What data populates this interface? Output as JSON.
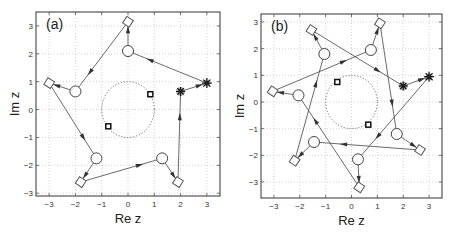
{
  "chart_data": [
    {
      "type": "scatter",
      "title": "(a)",
      "xlabel": "Re z",
      "ylabel": "Im z",
      "xlim": [
        -3.5,
        3.5
      ],
      "ylim": [
        -3.1,
        3.5
      ],
      "xticks": [
        -3,
        -2,
        -1,
        0,
        1,
        2,
        3
      ],
      "yticks": [
        -3,
        -2,
        -1,
        0,
        1,
        2,
        3
      ],
      "grid": true,
      "unit_circle": {
        "center": [
          0,
          0
        ],
        "radius": 1,
        "style": "dotted"
      },
      "path": [
        {
          "x": 2.0,
          "y": 0.65,
          "marker": "star"
        },
        {
          "x": 3.0,
          "y": 0.95,
          "marker": "star-filled"
        },
        {
          "x": 0.0,
          "y": 2.1,
          "marker": "circle"
        },
        {
          "x": 0.0,
          "y": 3.15,
          "marker": "diamond"
        },
        {
          "x": -2.0,
          "y": 0.65,
          "marker": "circle"
        },
        {
          "x": -3.0,
          "y": 0.95,
          "marker": "diamond"
        },
        {
          "x": -1.2,
          "y": -1.75,
          "marker": "circle"
        },
        {
          "x": -1.8,
          "y": -2.6,
          "marker": "diamond"
        },
        {
          "x": 1.3,
          "y": -1.75,
          "marker": "circle"
        },
        {
          "x": 1.9,
          "y": -2.6,
          "marker": "diamond"
        },
        {
          "x": 2.0,
          "y": 0.65,
          "marker": "star"
        }
      ],
      "squares": [
        {
          "x": 0.85,
          "y": 0.55
        },
        {
          "x": -0.75,
          "y": -0.6
        }
      ]
    },
    {
      "type": "scatter",
      "title": "(b)",
      "xlabel": "Re z",
      "ylabel": "Im z",
      "xlim": [
        -3.5,
        3.5
      ],
      "ylim": [
        -3.6,
        3.3
      ],
      "xticks": [
        -3,
        -2,
        -1,
        0,
        1,
        2,
        3
      ],
      "yticks": [
        -3,
        -2,
        -1,
        0,
        1,
        2,
        3
      ],
      "grid": true,
      "unit_circle": {
        "center": [
          0,
          0
        ],
        "radius": 1,
        "style": "dotted"
      },
      "path": [
        {
          "x": 2.0,
          "y": 0.6,
          "marker": "star"
        },
        {
          "x": 3.0,
          "y": 0.95,
          "marker": "star-filled"
        },
        {
          "x": 0.25,
          "y": -2.15,
          "marker": "circle"
        },
        {
          "x": 0.3,
          "y": -3.2,
          "marker": "diamond"
        },
        {
          "x": -2.05,
          "y": 0.25,
          "marker": "circle"
        },
        {
          "x": -3.05,
          "y": 0.4,
          "marker": "diamond"
        },
        {
          "x": 0.75,
          "y": 1.95,
          "marker": "circle"
        },
        {
          "x": 1.1,
          "y": 2.95,
          "marker": "diamond"
        },
        {
          "x": 1.75,
          "y": -1.2,
          "marker": "circle"
        },
        {
          "x": 2.65,
          "y": -1.8,
          "marker": "diamond"
        },
        {
          "x": -1.45,
          "y": -1.5,
          "marker": "circle"
        },
        {
          "x": -2.2,
          "y": -2.2,
          "marker": "diamond"
        },
        {
          "x": -1.05,
          "y": 1.8,
          "marker": "circle"
        },
        {
          "x": -1.55,
          "y": 2.7,
          "marker": "diamond"
        },
        {
          "x": 2.0,
          "y": 0.6,
          "marker": "star"
        }
      ],
      "squares": [
        {
          "x": -0.55,
          "y": 0.75
        },
        {
          "x": 0.65,
          "y": -0.85
        }
      ]
    }
  ],
  "panels": {
    "a": {
      "tag": "(a)",
      "xlabel": "Re z",
      "ylabel": "Im z"
    },
    "b": {
      "tag": "(b)",
      "xlabel": "Re z",
      "ylabel": "Im z"
    }
  }
}
